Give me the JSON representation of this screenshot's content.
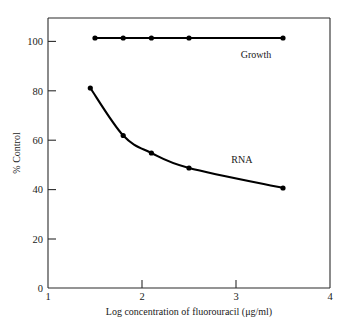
{
  "chart_data": {
    "type": "line",
    "title": "",
    "xlabel": "Log concentration of fluorouracil (μg/ml)",
    "ylabel": "% Control",
    "xlim": [
      1,
      4
    ],
    "ylim": [
      0,
      108
    ],
    "xticks": [
      "1",
      "2",
      "3",
      "4"
    ],
    "xtick_values": [
      1,
      2,
      3,
      4
    ],
    "yticks": [
      "0",
      "20",
      "40",
      "60",
      "80",
      "100"
    ],
    "ytick_values": [
      0,
      20,
      40,
      60,
      80,
      100
    ],
    "grid": false,
    "legend_position": "inline-annotations",
    "series": [
      {
        "name": "Growth",
        "label_text": "Growth",
        "label_x": 3.05,
        "label_y": 92,
        "x": [
          1.5,
          1.8,
          2.1,
          2.5,
          3.5
        ],
        "values": [
          100,
          100,
          100,
          100,
          100
        ]
      },
      {
        "name": "RNA",
        "label_text": "RNA",
        "label_x": 2.95,
        "label_y": 50,
        "x": [
          1.45,
          1.8,
          2.1,
          2.5,
          3.5
        ],
        "values": [
          80,
          61,
          54,
          48,
          40
        ]
      }
    ]
  },
  "figure": {
    "xaxis_title": "Log concentration of fluorouracil (μg/ml)",
    "yaxis_title": "% Control",
    "xtick_1": "1",
    "xtick_2": "2",
    "xtick_3": "3",
    "xtick_4": "4",
    "ytick_0": "0",
    "ytick_20": "20",
    "ytick_40": "40",
    "ytick_60": "60",
    "ytick_80": "80",
    "ytick_100": "100",
    "growth_label": "Growth",
    "rna_label": "RNA"
  },
  "colors": {
    "ink": "#000000",
    "axis": "#2b2b2b",
    "background": "#ffffff"
  }
}
